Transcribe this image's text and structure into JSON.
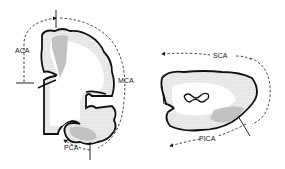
{
  "diagram": {
    "type": "vascular territories of brain sections",
    "panels": [
      {
        "name": "cerebral-hemisphere-coronal",
        "territories": [
          {
            "label": "ACA"
          },
          {
            "label": "MCA"
          },
          {
            "label": "PCA"
          }
        ]
      },
      {
        "name": "cerebellum-section",
        "territories": [
          {
            "label": "SCA"
          },
          {
            "label": "PICA"
          }
        ]
      }
    ],
    "colors": {
      "outline": "#111111",
      "stipple_light": "#c8c8c8",
      "stipple_dark": "#8a8a8a",
      "background": "#ffffff"
    }
  }
}
